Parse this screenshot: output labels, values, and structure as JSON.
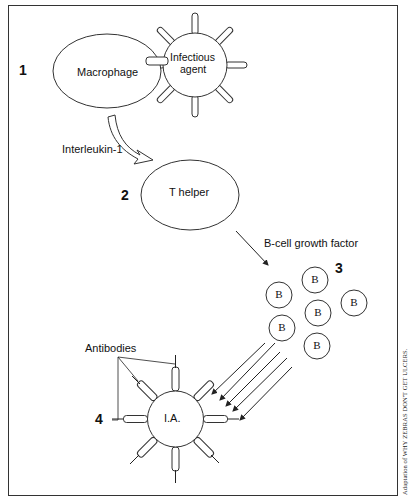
{
  "diagram": {
    "steps": [
      {
        "number": "1",
        "cell": "Macrophage",
        "partner": "Infectious agent",
        "partner_lines": [
          "Infectious",
          "agent"
        ]
      },
      {
        "number": "2",
        "cell": "T helper",
        "signal_in": "Interleukin-1"
      },
      {
        "number": "3",
        "cell": "B",
        "signal_in": "B-cell growth factor",
        "b_cell_count": 6
      },
      {
        "number": "4",
        "cell": "I.A.",
        "label": "Antibodies"
      }
    ],
    "labels": {
      "step1_number": "1",
      "macrophage": "Macrophage",
      "infectious_line1": "Infectious",
      "infectious_line2": "agent",
      "interleukin": "Interleukin-1",
      "step2_number": "2",
      "t_helper": "T helper",
      "b_growth_factor": "B-cell growth factor",
      "step3_number": "3",
      "b_cell": "B",
      "antibodies": "Antibodies",
      "step4_number": "4",
      "ia": "I.A."
    },
    "credit": "Adaptation of WHY ZEBRAS DON'T GET ULCERS."
  }
}
